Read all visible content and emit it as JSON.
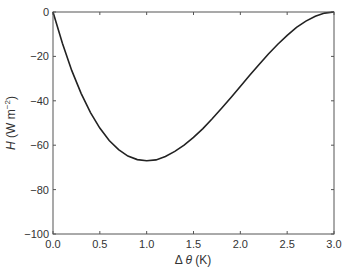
{
  "chart_data": {
    "type": "line",
    "title": "",
    "xlabel": "Δ θ (K)",
    "ylabel": "H (W m⁻²)",
    "xlim": [
      0,
      3
    ],
    "ylim": [
      -100,
      0
    ],
    "xticks": [
      "0.0",
      "0.5",
      "1.0",
      "1.5",
      "2.0",
      "2.5",
      "3.0"
    ],
    "yticks": [
      "0",
      "-20",
      "-40",
      "-60",
      "-80",
      "-100"
    ],
    "grid": false,
    "legend": null,
    "series": [
      {
        "name": "H",
        "x": [
          0.0,
          0.1,
          0.2,
          0.3,
          0.4,
          0.5,
          0.6,
          0.7,
          0.8,
          0.9,
          1.0,
          1.1,
          1.2,
          1.3,
          1.4,
          1.5,
          1.6,
          1.7,
          1.8,
          1.9,
          2.0,
          2.1,
          2.2,
          2.3,
          2.4,
          2.5,
          2.6,
          2.7,
          2.8,
          2.9,
          3.0
        ],
        "y": [
          0,
          -14.1,
          -26.3,
          -36.6,
          -45.3,
          -52.3,
          -57.9,
          -62.0,
          -64.9,
          -66.5,
          -67.0,
          -66.6,
          -65.1,
          -62.8,
          -60.0,
          -56.5,
          -52.5,
          -48.1,
          -43.4,
          -38.5,
          -33.5,
          -28.5,
          -23.6,
          -18.9,
          -14.5,
          -10.5,
          -6.9,
          -4.1,
          -1.9,
          -0.5,
          0
        ]
      }
    ]
  }
}
